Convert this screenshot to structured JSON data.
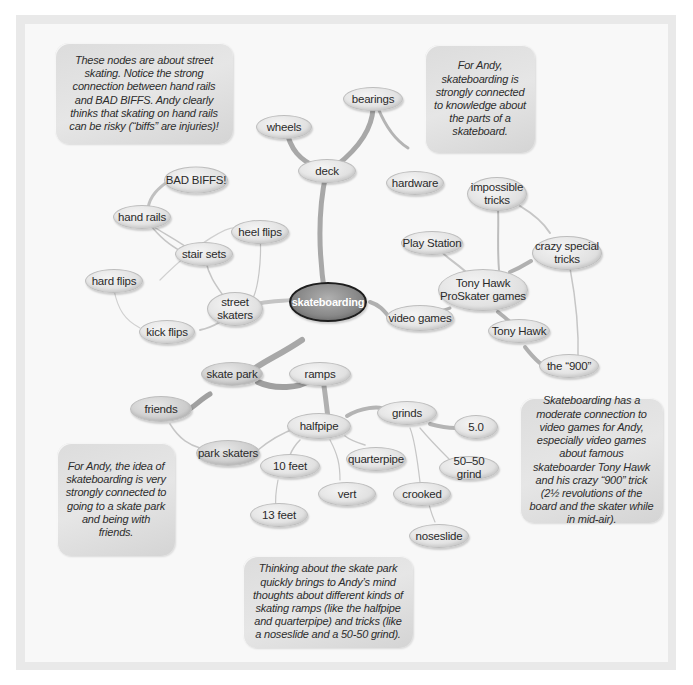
{
  "diagram": {
    "type": "concept-map",
    "center": {
      "label": "skateboarding"
    },
    "nodes": {
      "wheels": "wheels",
      "bearings": "bearings",
      "deck": "deck",
      "hardware": "hardware",
      "bad_biffs": "BAD BIFFS!",
      "hand_rails": "hand rails",
      "heel_flips": "heel flips",
      "stair_sets": "stair sets",
      "hard_flips": "hard flips",
      "street_skaters": "street skaters",
      "kick_flips": "kick flips",
      "impossible_tricks": "impossible tricks",
      "play_station": "Play Station",
      "crazy_special_tricks": "crazy special tricks",
      "tony_hawk_games": "Tony Hawk ProSkater games",
      "video_games": "video games",
      "tony_hawk": "Tony Hawk",
      "the_900": "the “900”",
      "skate_park": "skate park",
      "ramps": "ramps",
      "friends": "friends",
      "halfpipe": "halfpipe",
      "grinds": "grinds",
      "five_oh": "5.0",
      "park_skaters": "park skaters",
      "ten_feet": "10 feet",
      "quarterpipe": "quarterpipe",
      "fifty_fifty_grind": "50–50 grind",
      "vert": "vert",
      "crooked": "crooked",
      "thirteen_feet": "13 feet",
      "noseslide": "noseslide"
    },
    "notes": {
      "street": "These nodes are about street skating. Notice the strong connection between hand rails and BAD BIFFS. Andy clearly thinks that skating on hand rails can be risky (“biffs” are injuries)!",
      "parts": "For Andy, skateboarding is strongly connected to knowledge about the parts of a skateboard.",
      "video_games": "Skateboarding has a moderate connection to video games for Andy, especially video games about famous skateboarder Tony Hawk and his crazy “900” trick (2½ revolutions of the board and the skater while in mid-air).",
      "skate_park": "For Andy, the idea of skateboarding is very strongly connected to going to a skate park and being with friends.",
      "ramps": "Thinking about the skate park quickly brings to Andy’s mind thoughts about different kinds of skating ramps (like the halfpipe and quarterpipe) and tricks (like a noseslide and a 50-50 grind)."
    },
    "colors": {
      "frame": "#e9e9e9",
      "canvas": "#f8f8f8",
      "node_fill": "#e2e2e2",
      "center_fill": "#8a8a8a",
      "strong_link": "#a9a9a9",
      "weak_link": "#d0d0d0",
      "note_fill": "#dcdcdc"
    }
  }
}
